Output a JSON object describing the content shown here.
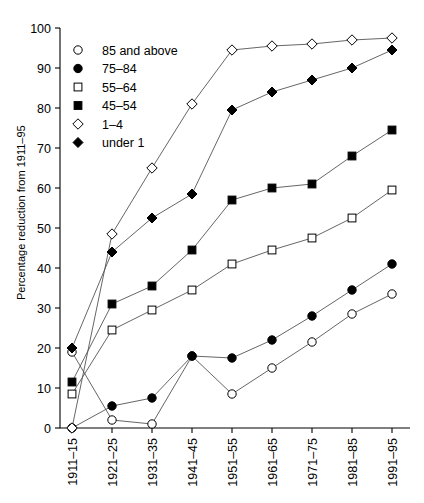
{
  "chart_data": {
    "type": "line",
    "title": "",
    "xlabel": "",
    "ylabel": "Percentage reduction from 1911–95",
    "categories": [
      "1911–15",
      "1921–25",
      "1931–35",
      "1941–45",
      "1951–55",
      "1961–65",
      "1971–75",
      "1981–85",
      "1991–95"
    ],
    "ylim": [
      0,
      100
    ],
    "yticks": [
      0,
      10,
      20,
      30,
      40,
      50,
      60,
      70,
      80,
      90,
      100
    ],
    "grid": false,
    "legend_position": "upper-left-inside",
    "series": [
      {
        "name": "85 and above",
        "marker": "open-circle",
        "values": [
          19,
          2,
          1,
          18,
          8.5,
          15,
          21.5,
          28.5,
          33.5
        ]
      },
      {
        "name": "75–84",
        "marker": "filled-circle",
        "values": [
          0,
          5.5,
          7.5,
          18,
          17.5,
          22,
          28,
          34.5,
          41
        ]
      },
      {
        "name": "55–64",
        "marker": "open-square",
        "values": [
          8.5,
          24.5,
          29.5,
          34.5,
          41,
          44.5,
          47.5,
          52.5,
          59.5
        ]
      },
      {
        "name": "45–54",
        "marker": "filled-square",
        "values": [
          11.5,
          31,
          35.5,
          44.5,
          57,
          60,
          61,
          68,
          74.5
        ]
      },
      {
        "name": "1–4",
        "marker": "open-diamond",
        "values": [
          0,
          48.5,
          65,
          81,
          94.5,
          95.5,
          96,
          97,
          97.5
        ]
      },
      {
        "name": "under 1",
        "marker": "filled-diamond",
        "values": [
          20,
          44,
          52.5,
          58.5,
          79.5,
          84,
          87,
          90,
          94.5
        ]
      }
    ]
  },
  "legend": {
    "items": [
      {
        "label": "85 and above",
        "marker": "open-circle"
      },
      {
        "label": "75–84",
        "marker": "filled-circle"
      },
      {
        "label": "55–64",
        "marker": "open-square"
      },
      {
        "label": "45–54",
        "marker": "filled-square"
      },
      {
        "label": "1–4",
        "marker": "open-diamond"
      },
      {
        "label": "under 1",
        "marker": "filled-diamond"
      }
    ]
  },
  "colors": {
    "axis": "#000000",
    "line": "#555555",
    "marker_fill": "#000000",
    "marker_open": "#ffffff",
    "background": "#ffffff"
  }
}
